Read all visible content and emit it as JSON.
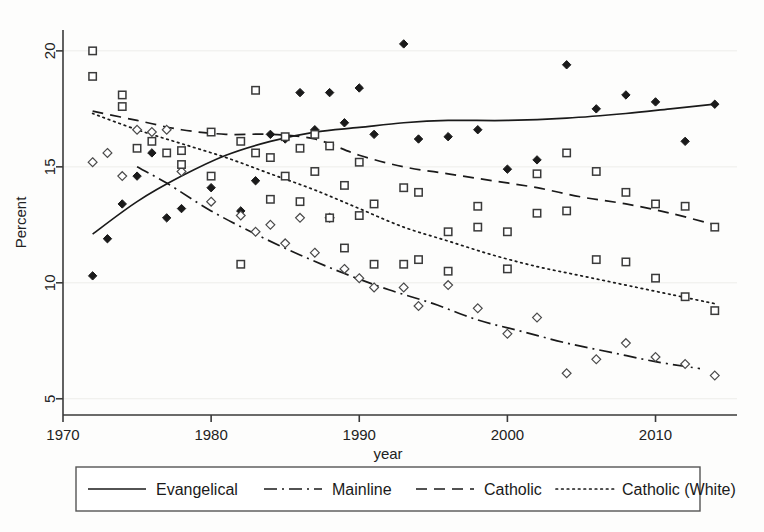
{
  "chart_data": {
    "type": "scatter",
    "title": "",
    "xlabel": "year",
    "ylabel": "Percent",
    "xlim": [
      1970.0,
      2015.5
    ],
    "ylim": [
      4.3,
      20.9
    ],
    "xticks": [
      1970,
      1980,
      1990,
      2000,
      2010
    ],
    "xtick_labels": [
      "1970",
      "1980",
      "1990",
      "2000",
      "2010"
    ],
    "yticks": [
      5,
      10,
      15,
      20
    ],
    "ytick_labels": [
      "5",
      "10",
      "15",
      "20"
    ],
    "grid": "faint-horizontal",
    "legend_position": "below-axes",
    "series": [
      {
        "name": "Evangelical",
        "line_style": "solid",
        "marker": "filled-diamond",
        "points": [
          [
            1972,
            10.3
          ],
          [
            1973,
            11.9
          ],
          [
            1974,
            13.4
          ],
          [
            1975,
            14.6
          ],
          [
            1976,
            15.6
          ],
          [
            1977,
            12.8
          ],
          [
            1978,
            13.2
          ],
          [
            1980,
            14.1
          ],
          [
            1982,
            13.1
          ],
          [
            1983,
            14.4
          ],
          [
            1984,
            16.4
          ],
          [
            1985,
            16.2
          ],
          [
            1986,
            18.2
          ],
          [
            1987,
            16.6
          ],
          [
            1988,
            18.2
          ],
          [
            1989,
            16.9
          ],
          [
            1990,
            18.4
          ],
          [
            1991,
            16.4
          ],
          [
            1993,
            20.3
          ],
          [
            1994,
            16.2
          ],
          [
            1996,
            16.3
          ],
          [
            1998,
            16.6
          ],
          [
            2000,
            14.9
          ],
          [
            2002,
            15.3
          ],
          [
            2004,
            19.4
          ],
          [
            2006,
            17.5
          ],
          [
            2008,
            18.1
          ],
          [
            2010,
            17.8
          ],
          [
            2012,
            16.1
          ],
          [
            2014,
            17.7
          ]
        ],
        "fit": [
          [
            1972,
            12.1
          ],
          [
            1975,
            13.5
          ],
          [
            1978,
            14.6
          ],
          [
            1981,
            15.5
          ],
          [
            1984,
            16.1
          ],
          [
            1987,
            16.5
          ],
          [
            1990,
            16.7
          ],
          [
            1993,
            16.9
          ],
          [
            1996,
            17.0
          ],
          [
            2000,
            17.0
          ],
          [
            2004,
            17.1
          ],
          [
            2008,
            17.3
          ],
          [
            2011,
            17.5
          ],
          [
            2014,
            17.7
          ]
        ]
      },
      {
        "name": "Mainline",
        "line_style": "dash-dot",
        "marker": "open-diamond",
        "points": [
          [
            1972,
            15.2
          ],
          [
            1973,
            15.6
          ],
          [
            1974,
            14.6
          ],
          [
            1975,
            16.6
          ],
          [
            1976,
            16.5
          ],
          [
            1977,
            16.6
          ],
          [
            1978,
            14.8
          ],
          [
            1980,
            13.5
          ],
          [
            1982,
            12.9
          ],
          [
            1983,
            12.2
          ],
          [
            1984,
            12.5
          ],
          [
            1985,
            11.7
          ],
          [
            1986,
            12.8
          ],
          [
            1987,
            11.3
          ],
          [
            1988,
            12.8
          ],
          [
            1989,
            10.6
          ],
          [
            1990,
            10.2
          ],
          [
            1991,
            9.8
          ],
          [
            1993,
            9.8
          ],
          [
            1994,
            9.0
          ],
          [
            1996,
            9.9
          ],
          [
            1998,
            8.9
          ],
          [
            2000,
            7.8
          ],
          [
            2002,
            8.5
          ],
          [
            2004,
            6.1
          ],
          [
            2006,
            6.7
          ],
          [
            2008,
            7.4
          ],
          [
            2010,
            6.8
          ],
          [
            2012,
            6.5
          ],
          [
            2014,
            6.0
          ]
        ],
        "fit": [
          [
            1975,
            15.0
          ],
          [
            1977,
            14.3
          ],
          [
            1980,
            13.1
          ],
          [
            1983,
            12.1
          ],
          [
            1986,
            11.2
          ],
          [
            1989,
            10.4
          ],
          [
            1992,
            9.7
          ],
          [
            1995,
            9.1
          ],
          [
            1998,
            8.4
          ],
          [
            2001,
            7.9
          ],
          [
            2004,
            7.4
          ],
          [
            2007,
            7.0
          ],
          [
            2010,
            6.6
          ],
          [
            2013,
            6.3
          ]
        ]
      },
      {
        "name": "Catholic",
        "line_style": "dashed",
        "marker": "open-square",
        "points": [
          [
            1972,
            18.9
          ],
          [
            1974,
            18.1
          ],
          [
            1975,
            15.8
          ],
          [
            1977,
            15.6
          ],
          [
            1978,
            15.7
          ],
          [
            1980,
            16.5
          ],
          [
            1982,
            16.1
          ],
          [
            1983,
            18.3
          ],
          [
            1984,
            15.4
          ],
          [
            1985,
            16.3
          ],
          [
            1986,
            15.8
          ],
          [
            1987,
            16.4
          ],
          [
            1988,
            15.9
          ],
          [
            1989,
            14.2
          ],
          [
            1990,
            15.2
          ],
          [
            1991,
            13.4
          ],
          [
            1993,
            14.1
          ],
          [
            1994,
            13.9
          ],
          [
            1996,
            12.2
          ],
          [
            1998,
            13.3
          ],
          [
            2000,
            12.2
          ],
          [
            2002,
            14.7
          ],
          [
            2004,
            15.6
          ],
          [
            2006,
            14.8
          ],
          [
            2008,
            13.9
          ],
          [
            2010,
            13.4
          ],
          [
            2012,
            13.3
          ],
          [
            2014,
            12.4
          ]
        ],
        "fit": [
          [
            1972,
            17.4
          ],
          [
            1975,
            17.0
          ],
          [
            1978,
            16.6
          ],
          [
            1981,
            16.4
          ],
          [
            1984,
            16.4
          ],
          [
            1987,
            16.2
          ],
          [
            1990,
            15.5
          ],
          [
            1993,
            15.0
          ],
          [
            1996,
            14.7
          ],
          [
            1999,
            14.4
          ],
          [
            2002,
            14.1
          ],
          [
            2005,
            13.7
          ],
          [
            2008,
            13.4
          ],
          [
            2011,
            13.0
          ],
          [
            2014,
            12.5
          ]
        ]
      },
      {
        "name": "Catholic (White)",
        "line_style": "dotted",
        "marker": "open-square",
        "points": [
          [
            1972,
            20.0
          ],
          [
            1974,
            17.6
          ],
          [
            1976,
            16.1
          ],
          [
            1978,
            15.1
          ],
          [
            1980,
            14.6
          ],
          [
            1982,
            10.8
          ],
          [
            1983,
            15.6
          ],
          [
            1984,
            13.6
          ],
          [
            1985,
            14.6
          ],
          [
            1986,
            13.5
          ],
          [
            1987,
            14.8
          ],
          [
            1988,
            12.8
          ],
          [
            1989,
            11.5
          ],
          [
            1990,
            12.9
          ],
          [
            1991,
            10.8
          ],
          [
            1993,
            10.8
          ],
          [
            1994,
            11.0
          ],
          [
            1996,
            10.5
          ],
          [
            1998,
            12.4
          ],
          [
            2000,
            10.6
          ],
          [
            2002,
            13.0
          ],
          [
            2004,
            13.1
          ],
          [
            2006,
            11.0
          ],
          [
            2008,
            10.9
          ],
          [
            2010,
            10.2
          ],
          [
            2012,
            9.4
          ],
          [
            2014,
            8.8
          ]
        ],
        "fit": [
          [
            1972,
            17.3
          ],
          [
            1975,
            16.6
          ],
          [
            1978,
            16.0
          ],
          [
            1981,
            15.4
          ],
          [
            1984,
            14.7
          ],
          [
            1987,
            14.0
          ],
          [
            1990,
            13.2
          ],
          [
            1993,
            12.4
          ],
          [
            1996,
            11.8
          ],
          [
            1999,
            11.2
          ],
          [
            2002,
            10.7
          ],
          [
            2005,
            10.3
          ],
          [
            2008,
            9.9
          ],
          [
            2011,
            9.5
          ],
          [
            2014,
            9.1
          ]
        ]
      }
    ]
  },
  "legend": {
    "entries": [
      {
        "label": "Evangelical",
        "style": "solid"
      },
      {
        "label": "Mainline",
        "style": "dash-dot"
      },
      {
        "label": "Catholic",
        "style": "dashed"
      },
      {
        "label": "Catholic (White)",
        "style": "dotted"
      }
    ]
  },
  "colors": {
    "ink": "#1a1a1a",
    "axis": "#3a3a3a",
    "grid": "#ededea",
    "background": "#fdfdfc"
  }
}
